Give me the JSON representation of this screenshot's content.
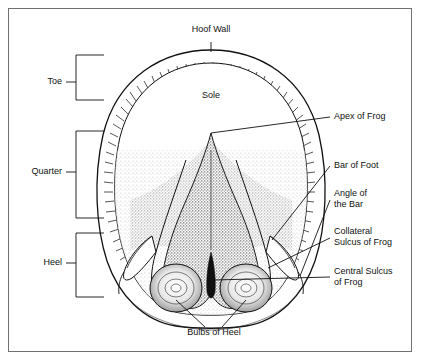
{
  "figure": {
    "background_color": "#ffffff",
    "border_color": "#6f6f6f",
    "ink_color": "#111111"
  },
  "labels": {
    "hoof_wall": "Hoof Wall",
    "sole": "Sole",
    "toe": "Toe",
    "quarter": "Quarter",
    "heel": "Heel",
    "apex_of_frog": "Apex of Frog",
    "bar_of_foot": "Bar of Foot",
    "angle_of_the_bar": "Angle of\nthe Bar",
    "collateral_sulcus_of_frog": "Collateral\nSulcus of Frog",
    "central_sulcus_of_frog": "Central Sulcus\nof Frog",
    "bulbs_of_heel": "Bulbs of Heel"
  }
}
